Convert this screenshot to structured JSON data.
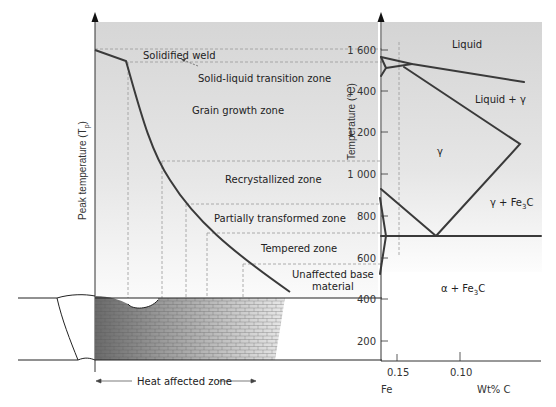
{
  "left_panel": {
    "y_axis_label": "Peak temperature (T",
    "y_axis_sub": "p",
    "y_axis_close": ")",
    "zones": [
      {
        "id": "solidified-weld",
        "label": "Solidified weld"
      },
      {
        "id": "solid-liquid",
        "label": "Solid-liquid transition zone"
      },
      {
        "id": "grain-growth",
        "label": "Grain growth zone"
      },
      {
        "id": "recrystallized",
        "label": "Recrystallized zone"
      },
      {
        "id": "partially-transformed",
        "label": "Partially transformed zone"
      },
      {
        "id": "tempered",
        "label": "Tempered zone"
      },
      {
        "id": "unaffected-1",
        "label": "Unaffected base"
      },
      {
        "id": "unaffected-2",
        "label": "material"
      }
    ],
    "haz_label": "Heat affected zone"
  },
  "right_panel": {
    "y_axis_label": "Temperature (°C)",
    "y_ticks": [
      "1 600",
      "1 400",
      "1 200",
      "1 000",
      "800",
      "600",
      "400",
      "200"
    ],
    "x_ticks": [
      "0.15",
      "0.10"
    ],
    "x_origin_label": "Fe",
    "x_axis_label": "Wt% C",
    "phases": {
      "liquid": "Liquid",
      "liquid_gamma": "Liquid + γ",
      "gamma": "γ",
      "gamma_fe3c_a": "γ + Fe",
      "gamma_fe3c_sub": "3",
      "gamma_fe3c_b": "C",
      "alpha_fe3c_a": "α + Fe",
      "alpha_fe3c_sub": "3",
      "alpha_fe3c_b": "C"
    }
  },
  "colors": {
    "panel_bg_top": "#dcdcdc",
    "panel_bg_bottom": "#ffffff",
    "curve": "#3a3a3a",
    "dash": "#999999"
  }
}
